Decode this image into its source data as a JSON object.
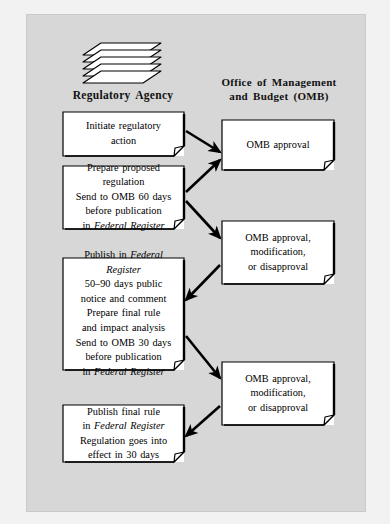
{
  "figure": {
    "type": "process-flowchart",
    "background_color": "#d7d7d7",
    "box_fill_color": "#ffffff",
    "line_color": "#000000"
  },
  "columns": {
    "left": {
      "heading": "Regulatory Agency",
      "icon": "stacked-papers-icon"
    },
    "right": {
      "heading_line1": "Office of Management",
      "heading_line2": "and Budget (OMB)"
    }
  },
  "agency_steps": [
    {
      "id": "initiate",
      "lines": [
        {
          "text": "Initiate regulatory"
        },
        {
          "text": "action"
        }
      ]
    },
    {
      "id": "prepare",
      "lines": [
        {
          "text": "Prepare proposed"
        },
        {
          "text": "regulation"
        },
        {
          "text": "Send to OMB 60 days"
        },
        {
          "text": "before publication"
        },
        {
          "pre": "in ",
          "italic": "Federal Register",
          "post": ""
        }
      ]
    },
    {
      "id": "publish",
      "lines": [
        {
          "pre": "Publish in ",
          "italic": "Federal",
          "post": ""
        },
        {
          "italic": "Register"
        },
        {
          "text": "50–90 days public"
        },
        {
          "text": "notice and comment"
        },
        {
          "text": "Prepare final rule"
        },
        {
          "text": "and impact analysis"
        },
        {
          "text": "Send to OMB 30 days"
        },
        {
          "text": "before publication"
        },
        {
          "pre": "in ",
          "italic": "Federal Register",
          "post": ""
        }
      ]
    },
    {
      "id": "final-rule",
      "lines": [
        {
          "text": "Publish final rule"
        },
        {
          "pre": "in ",
          "italic": "Federal Register",
          "post": ""
        },
        {
          "text": "Regulation goes into"
        },
        {
          "text": "effect in 30 days"
        }
      ]
    }
  ],
  "omb_steps": [
    {
      "id": "omb-approval",
      "lines": [
        {
          "text": "OMB approval"
        }
      ]
    },
    {
      "id": "omb-decision-1",
      "lines": [
        {
          "text": "OMB approval,"
        },
        {
          "text": "modification,"
        },
        {
          "text": "or disapproval"
        }
      ]
    },
    {
      "id": "omb-decision-2",
      "lines": [
        {
          "text": "OMB approval,"
        },
        {
          "text": "modification,"
        },
        {
          "text": "or disapproval"
        }
      ]
    }
  ],
  "flow_arrows": [
    {
      "from": "initiate",
      "to": "omb-approval",
      "direction": "right-down"
    },
    {
      "from": "prepare",
      "to": "omb-approval",
      "direction": "right-up"
    },
    {
      "from": "prepare",
      "to": "omb-decision-1",
      "direction": "right-down"
    },
    {
      "from": "omb-decision-1",
      "to": "publish",
      "direction": "left-down"
    },
    {
      "from": "publish",
      "to": "omb-decision-2",
      "direction": "right-down"
    },
    {
      "from": "omb-decision-2",
      "to": "final-rule",
      "direction": "left-down"
    }
  ]
}
